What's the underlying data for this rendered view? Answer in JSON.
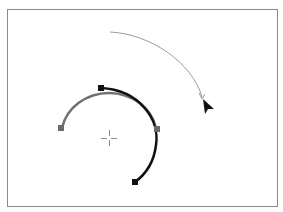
{
  "figure": {
    "frame_color": "#8a8a8a",
    "original_path": {
      "label": "original-arc",
      "color": "#707070",
      "start_anchor": [
        61,
        128
      ],
      "end_anchor": [
        157,
        129
      ]
    },
    "rotated_path": {
      "label": "rotated-arc",
      "color": "#111111",
      "start_anchor": [
        101,
        88
      ],
      "end_anchor": [
        135,
        182
      ]
    },
    "rotation_origin": [
      109,
      138
    ],
    "drag_arc": {
      "color": "#9a9a9a",
      "start": [
        110,
        32
      ],
      "end": [
        202,
        99
      ]
    },
    "cursor": {
      "icon": "arrow-cursor-icon",
      "position": [
        204,
        100
      ]
    }
  }
}
